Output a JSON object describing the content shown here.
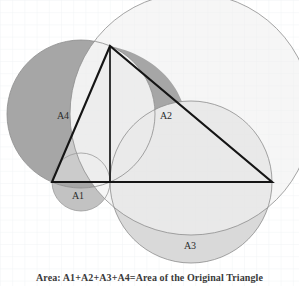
{
  "figure": {
    "title_caption": "Area: A1+A2+A3+A4=Area of the Original Triangle",
    "background": "#ffffff",
    "grid_color": "#eef1f4",
    "colors": {
      "outline": "#8d8d8d",
      "triangle_stroke": "#151515",
      "lune_dark": "#a6a6a6",
      "lune_mid": "#c2c2c2",
      "lune_light": "#d9d9d9",
      "lune_lighter": "#e2e2e2"
    },
    "labels": [
      {
        "id": "A1",
        "text": "A1",
        "x": 78,
        "y": 199
      },
      {
        "id": "A2",
        "text": "A2",
        "x": 166,
        "y": 119
      },
      {
        "id": "A3",
        "text": "A3",
        "x": 190,
        "y": 249
      },
      {
        "id": "A4",
        "text": "A4",
        "x": 63,
        "y": 119
      }
    ],
    "geometry": {
      "vertex_apex": [
        110,
        46
      ],
      "vertex_left": [
        52,
        182
      ],
      "vertex_right": [
        272,
        182
      ],
      "altitude_foot": [
        110,
        182
      ],
      "circle_left": {
        "cx": 81,
        "cy": 114,
        "r": 74
      },
      "circle_right": {
        "cx": 191,
        "cy": 114,
        "r": 121
      },
      "circle_base": {
        "cx": 191,
        "cy": 182,
        "r": 81
      },
      "semicircle_hyp": {
        "cx": 191,
        "cy": 114,
        "r": 121
      }
    }
  }
}
